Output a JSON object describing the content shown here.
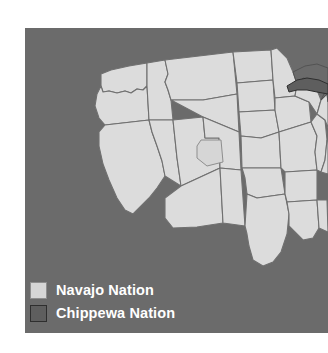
{
  "figure": {
    "width": 328,
    "height": 353,
    "background_color": "#ffffff"
  },
  "map": {
    "region": "Continental United States",
    "panel_background_color": "#6b6b6b",
    "state_fill_color": "#dcdcdc",
    "state_border_color": "#707070",
    "water_color": "#6b6b6b",
    "panel": {
      "x": 25,
      "y": 28,
      "width": 303,
      "height": 305
    },
    "highlight_regions": [
      {
        "name": "Navajo Nation",
        "location": "Four Corners (Arizona, New Mexico, Utah)",
        "fill_color": "#d6d6d6",
        "border_color": "#8e8e8e"
      },
      {
        "name": "Chippewa Nation",
        "location": "Upper Peninsula of Michigan / Great Lakes",
        "fill_color": "#5e5e5e",
        "border_color": "#2e2e2e"
      }
    ]
  },
  "legend": {
    "text_color": "#ffffff",
    "items": [
      {
        "label": "Navajo Nation",
        "swatch_color": "#d6d6d6"
      },
      {
        "label": "Chippewa Nation",
        "swatch_color": "#5e5e5e"
      }
    ]
  }
}
